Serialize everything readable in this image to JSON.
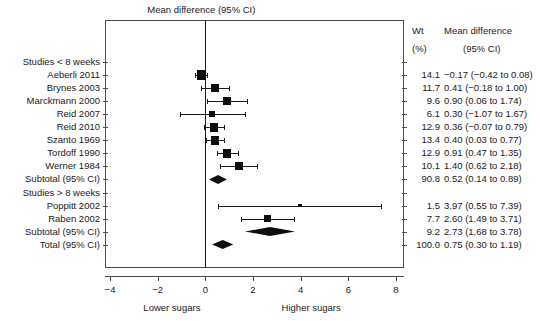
{
  "chart_data": {
    "type": "forest",
    "title": "Mean difference (95% CI)",
    "xlabel_left": "Lower sugars",
    "xlabel_right": "Higher sugars",
    "xlim": [
      -4.6,
      8.6
    ],
    "xticks": [
      -4,
      -2,
      0,
      2,
      4,
      6,
      8
    ],
    "xtick_labels": [
      "−4",
      "−2",
      "0",
      "2",
      "4",
      "6",
      "8"
    ],
    "null_value": 0,
    "columns": {
      "weight_header_line1": "Wt",
      "weight_header_line2": "(%)",
      "effect_header_line1": "Mean difference",
      "effect_header_line2": "(95% CI)"
    },
    "rows": [
      {
        "label": "Studies < 8 weeks",
        "kind": "heading"
      },
      {
        "label": "Aeberli 2011",
        "kind": "study",
        "est": -0.17,
        "lo": -0.42,
        "hi": 0.08,
        "weight": "14.1",
        "effect_text": "−0.17 (−0.42 to 0.08)"
      },
      {
        "label": "Brynes 2003",
        "kind": "study",
        "est": 0.41,
        "lo": -0.18,
        "hi": 1.0,
        "weight": "11.7",
        "effect_text": "0.41 (−0.18 to 1.00)"
      },
      {
        "label": "Marckmann 2000",
        "kind": "study",
        "est": 0.9,
        "lo": 0.06,
        "hi": 1.74,
        "weight": "9.6",
        "effect_text": "0.90 (0.06 to 1.74)"
      },
      {
        "label": "Reid 2007",
        "kind": "study",
        "est": 0.3,
        "lo": -1.07,
        "hi": 1.67,
        "weight": "6.1",
        "effect_text": "0.30 (−1.07 to 1.67)"
      },
      {
        "label": "Reid 2010",
        "kind": "study",
        "est": 0.36,
        "lo": -0.07,
        "hi": 0.79,
        "weight": "12.9",
        "effect_text": "0.36 (−0.07 to 0.79)"
      },
      {
        "label": "Szanto 1969",
        "kind": "study",
        "est": 0.4,
        "lo": 0.03,
        "hi": 0.77,
        "weight": "13.4",
        "effect_text": "0.40 (0.03 to 0.77)"
      },
      {
        "label": "Tordoff 1990",
        "kind": "study",
        "est": 0.91,
        "lo": 0.47,
        "hi": 1.35,
        "weight": "12.9",
        "effect_text": "0.91 (0.47 to 1.35)"
      },
      {
        "label": "Werner 1984",
        "kind": "study",
        "est": 1.4,
        "lo": 0.62,
        "hi": 2.18,
        "weight": "10.1",
        "effect_text": "1.40 (0.62 to 2.18)"
      },
      {
        "label": "Subtotal (95% CI)",
        "kind": "summary",
        "est": 0.52,
        "lo": 0.14,
        "hi": 0.89,
        "weight": "90.8",
        "effect_text": "0.52 (0.14 to 0.89)"
      },
      {
        "label": "Studies > 8 weeks",
        "kind": "heading"
      },
      {
        "label": "Poppitt 2002",
        "kind": "study",
        "est": 3.97,
        "lo": 0.55,
        "hi": 7.39,
        "weight": "1.5",
        "effect_text": "3.97 (0.55 to 7.39)"
      },
      {
        "label": "Raben 2002",
        "kind": "study",
        "est": 2.6,
        "lo": 1.49,
        "hi": 3.71,
        "weight": "7.7",
        "effect_text": "2.60 (1.49 to 3.71)"
      },
      {
        "label": "Subtotal (95% CI)",
        "kind": "summary",
        "est": 2.73,
        "lo": 1.68,
        "hi": 3.78,
        "weight": "9.2",
        "effect_text": "2.73 (1.68 to 3.78)"
      },
      {
        "label": "Total (95% CI)",
        "kind": "summary",
        "est": 0.75,
        "lo": 0.3,
        "hi": 1.19,
        "weight": "100.0",
        "effect_text": "0.75  (0.30 to 1.19)"
      }
    ],
    "marker_sizes": {
      "Aeberli 2011": 9.5,
      "Brynes 2003": 8.0,
      "Marckmann 2000": 7.5,
      "Reid 2007": 6.0,
      "Reid 2010": 8.5,
      "Szanto 1969": 8.5,
      "Tordoff 1990": 8.5,
      "Werner 1984": 8.0,
      "Poppitt 2002": 3.5,
      "Raben 2002": 7.5
    }
  }
}
